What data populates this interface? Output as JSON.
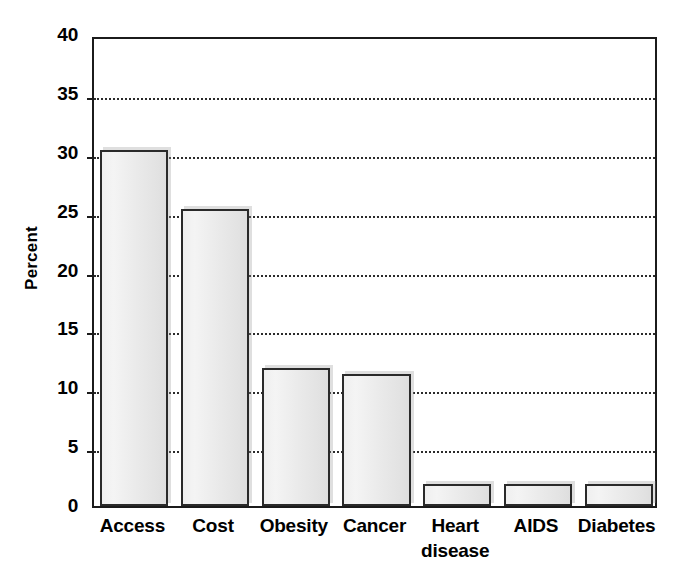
{
  "figure": {
    "background_color": "#ffffff",
    "bar_fill_color": "#ededed",
    "bar_outline_color": "#2a2a2a",
    "gridline_color": "#2b2b2b",
    "axis_color": "#1b1b1b"
  },
  "chart_data": {
    "type": "bar",
    "title": "",
    "subtitle": "",
    "xlabel": "",
    "ylabel": "Percent",
    "ylim": [
      0,
      40
    ],
    "ytick_step": 5,
    "yticks": [
      40,
      35,
      30,
      25,
      20,
      15,
      10,
      5,
      0
    ],
    "ytick_labels": [
      "40",
      "35",
      "30",
      "25",
      "20",
      "15",
      "10",
      "5",
      "0"
    ],
    "grid": true,
    "grid_axis": "y",
    "grid_style": "dotted",
    "legend": false,
    "legend_position": "none",
    "value_unit": "percent",
    "categories": [
      "Access",
      "Cost",
      "Obesity",
      "Cancer",
      "Heart disease",
      "AIDS",
      "Diabetes"
    ],
    "category_labels": [
      [
        "Access"
      ],
      [
        "Cost"
      ],
      [
        "Obesity"
      ],
      [
        "Cancer"
      ],
      [
        "Heart",
        "disease"
      ],
      [
        "AIDS"
      ],
      [
        "Diabetes"
      ]
    ],
    "values": [
      30.2,
      25.2,
      11.7,
      11.2,
      1.9,
      1.9,
      1.9
    ],
    "annotations": []
  }
}
